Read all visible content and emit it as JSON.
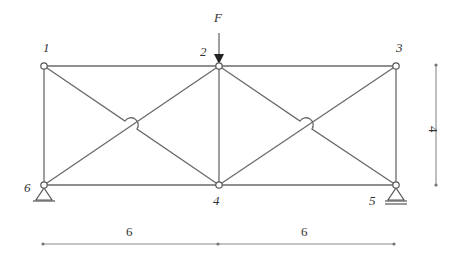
{
  "diagram": {
    "type": "truss",
    "load": {
      "label": "F",
      "node": "2",
      "direction": "down"
    },
    "nodes": [
      {
        "id": "1",
        "label": "1",
        "x": 44,
        "y": 66
      },
      {
        "id": "2",
        "label": "2",
        "x": 219,
        "y": 66
      },
      {
        "id": "3",
        "label": "3",
        "x": 396,
        "y": 66
      },
      {
        "id": "4",
        "label": "4",
        "x": 219,
        "y": 185
      },
      {
        "id": "5",
        "label": "5",
        "x": 396,
        "y": 185
      },
      {
        "id": "6",
        "label": "6",
        "x": 44,
        "y": 185
      }
    ],
    "members": [
      [
        "1",
        "2"
      ],
      [
        "2",
        "3"
      ],
      [
        "6",
        "4"
      ],
      [
        "4",
        "5"
      ],
      [
        "1",
        "6"
      ],
      [
        "2",
        "4"
      ],
      [
        "3",
        "5"
      ],
      [
        "1",
        "4"
      ],
      [
        "6",
        "2"
      ],
      [
        "2",
        "5"
      ],
      [
        "4",
        "3"
      ]
    ],
    "supports": [
      {
        "node": "6",
        "type": "pin"
      },
      {
        "node": "5",
        "type": "roller"
      }
    ],
    "dimensions": {
      "horizontal": [
        {
          "label": "6"
        },
        {
          "label": "6"
        }
      ],
      "vertical": {
        "label": "4"
      }
    }
  }
}
